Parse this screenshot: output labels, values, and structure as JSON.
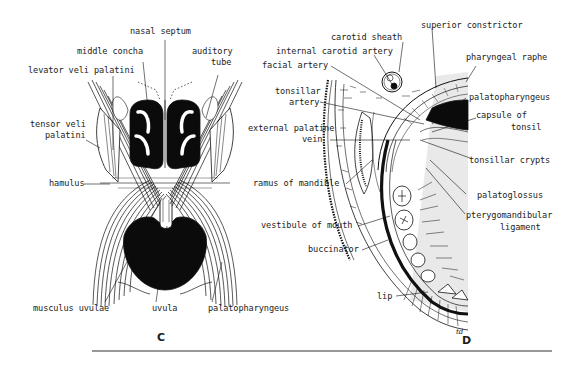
{
  "figure_c": {
    "letter": "C",
    "labels": {
      "nasal_septum": "nasal septum",
      "middle_concha": "middle concha",
      "auditory_tube_1": "auditory",
      "auditory_tube_2": "tube",
      "levator": "levator veli palatini",
      "tensor_1": "tensor veli",
      "tensor_2": "palatini",
      "hamulus": "hamulus",
      "musculus_uvulae": "musculus uvulae",
      "uvula": "uvula",
      "palatopharyngeus": "palatopharyngeus"
    }
  },
  "figure_d": {
    "letter": "D",
    "labels": {
      "superior_constrictor": "superior constrictor",
      "carotid_sheath": "carotid sheath",
      "internal_carotid": "internal carotid artery",
      "facial_artery": "facial artery",
      "pharyngeal_raphe": "pharyngeal raphe",
      "tonsillar_artery_1": "tonsillar",
      "tonsillar_artery_2": "artery",
      "palatopharyngeus": "palatopharyngeus",
      "capsule_1": "capsule of",
      "capsule_2": "tonsil",
      "ext_palatine_1": "external palatine",
      "ext_palatine_2": "vein",
      "tonsillar_crypts": "tonsillar crypts",
      "ramus": "ramus of mandible",
      "palatoglossus": "palatoglossus",
      "vestibule": "vestibule of mouth",
      "pterygo_1": "pterygomandibular",
      "pterygo_2": "ligament",
      "buccinator": "buccinator",
      "lip": "lip"
    }
  }
}
